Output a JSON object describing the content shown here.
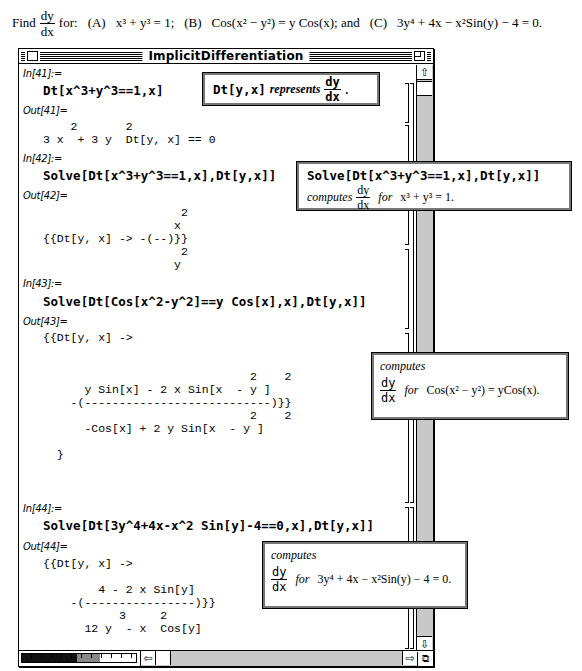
{
  "problem": {
    "find": "Find",
    "dy": "dy",
    "dx": "dx",
    "for": "for:",
    "a_label": "(A)",
    "a_eq": "x³ + y³ = 1;",
    "b_label": "(B)",
    "b_eq": "Cos(x² − y²) = y Cos(x);",
    "and": "and",
    "c_label": "(C)",
    "c_eq": "3y⁴ + 4x − x²Sin(y) − 4 = 0."
  },
  "window": {
    "title": "ImplicitDifferentiation",
    "close_icon": "close-box",
    "zoom_icon": "zoom-box",
    "vscroll": {
      "up_icon": "⇧",
      "down_icon": "⇩"
    },
    "hscroll": {
      "left_icon": "⇦",
      "right_icon": "⇨",
      "grow_icon": "⧉"
    }
  },
  "cells": [
    {
      "in_label": "In[41]:=",
      "input": "Dt[x^3+y^3==1,x]",
      "out_label": "Out[41]=",
      "output": "    2       2\n3 x  + 3 y  Dt[y, x] == 0"
    },
    {
      "in_label": "In[42]:=",
      "input": "Solve[Dt[x^3+y^3==1,x],Dt[y,x]]",
      "out_label": "Out[42]=",
      "output": "                    2\n                   x\n{{Dt[y, x] -> -(--)}}\n                    2\n                   y"
    },
    {
      "in_label": "In[43]:=",
      "input": "Solve[Dt[Cos[x^2-y^2]==y Cos[x],x],Dt[y,x]]",
      "out_label": "Out[43]=",
      "output": "{{Dt[y, x] ->\n\n\n                              2    2\n      y Sin[x] - 2 x Sin[x  - y ]\n    -(---------------------------)}}\n                              2    2\n      -Cos[x] + 2 y Sin[x  - y ]\n\n  }"
    },
    {
      "in_label": "In[44]:=",
      "input": "Solve[Dt[3y^4+4x-x^2 Sin[y]-4==0,x],Dt[y,x]]",
      "out_label": "Out[44]=",
      "output": "{{Dt[y, x] ->\n\n        4 - 2 x Sin[y]\n    -(----------------)}}\n           3     2\n      12 y  - x  Cos[y]"
    }
  ],
  "callouts": [
    {
      "code": "Dt[y,x]",
      "text": "represents",
      "dy": "dy",
      "dx": "dx",
      "end": "."
    },
    {
      "code": "Solve[Dt[x^3+y^3==1,x],Dt[y,x]]",
      "text": "computes",
      "dy": "dy",
      "dx": "dx",
      "for": "for",
      "eq": "x³ + y³ = 1."
    },
    {
      "text": "computes",
      "dy": "dy",
      "dx": "dx",
      "for": "for",
      "eq": "Cos(x² − y²) = yCos(x)."
    },
    {
      "text": "computes",
      "dy": "dy",
      "dx": "dx",
      "for": "for",
      "eq": "3y⁴ + 4x − x²Sin(y) − 4 = 0."
    }
  ]
}
